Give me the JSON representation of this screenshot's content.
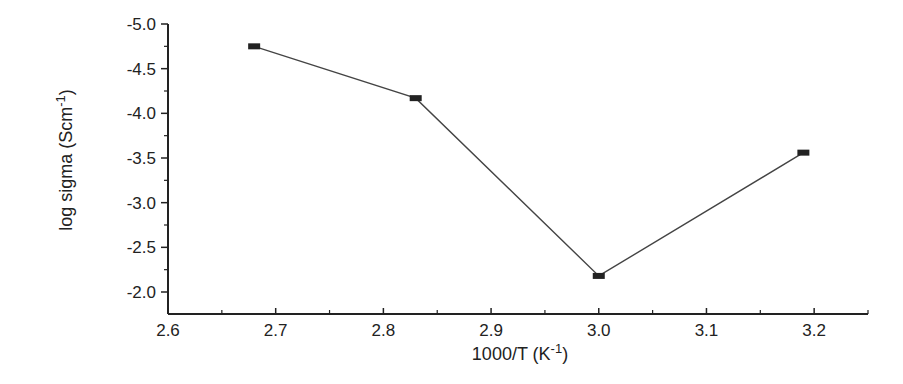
{
  "chart_data": {
    "type": "line",
    "title": "",
    "xlabel": "1000/T (K^-1)",
    "xlabel_main": "1000/T (K",
    "xlabel_sup": "-1",
    "xlabel_close": ")",
    "ylabel": "log sigma (Scm^-1)",
    "ylabel_main": "log sigma (Scm",
    "ylabel_sup": "-1",
    "ylabel_close": ")",
    "xlim": [
      2.6,
      3.25
    ],
    "ylim": [
      -2.0,
      -5.0
    ],
    "y_inverted": true,
    "x_ticks": [
      "2.6",
      "2.7",
      "2.8",
      "2.9",
      "3.0",
      "3.1",
      "3.2"
    ],
    "y_ticks": [
      "-5.0",
      "-4.5",
      "-4.0",
      "-3.5",
      "-3.0",
      "-2.5",
      "-2.0"
    ],
    "grid": false,
    "legend": null,
    "series": [
      {
        "name": "log sigma",
        "marker": "square",
        "color": "#222222",
        "x": [
          2.68,
          2.83,
          3.0,
          3.19
        ],
        "y": [
          -4.75,
          -4.17,
          -2.18,
          -3.56
        ]
      }
    ]
  }
}
